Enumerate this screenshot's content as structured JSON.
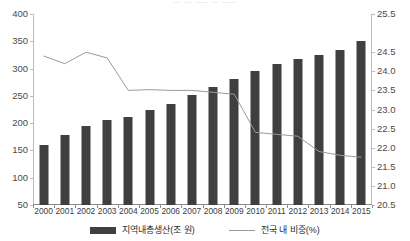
{
  "chart_data": {
    "type": "bar",
    "title": "",
    "xlabel": "",
    "ylabel": "",
    "grid": false,
    "legend_position": "bottom",
    "categories": [
      "2000",
      "2001",
      "2002",
      "2003",
      "2004",
      "2005",
      "2006",
      "2007",
      "2008",
      "2009",
      "2010",
      "2011",
      "2012",
      "2013",
      "2014",
      "2015"
    ],
    "axes": {
      "left": {
        "label": "지역내총생산(조 원)",
        "ylim": [
          0,
          400
        ],
        "ticks": [
          50,
          100,
          150,
          200,
          250,
          300,
          350,
          400
        ],
        "tick_labels": [
          "50",
          "100",
          "150",
          "200",
          "250",
          "300",
          "350",
          "400"
        ],
        "display_min": 50,
        "display_max": 400
      },
      "right": {
        "label": "전국 내 비중(%)",
        "ylim": [
          20.5,
          25.5
        ],
        "ticks": [
          20.5,
          21.0,
          21.5,
          22.0,
          22.5,
          23.0,
          23.5,
          24.0,
          24.5,
          25.5
        ],
        "tick_labels": [
          "20.5",
          "21.0",
          "21.5",
          "22.0",
          "22.5",
          "23.0",
          "23.5",
          "24.0",
          "24.5",
          "25.5"
        ],
        "display_min": 20.5,
        "display_max": 25.5
      }
    },
    "series": [
      {
        "name": "지역내총생산(조 원)",
        "type": "bar",
        "axis": "left",
        "color": "#3f3f3f",
        "values": [
          160,
          178,
          195,
          205,
          211,
          225,
          235,
          252,
          267,
          280,
          295,
          308,
          317,
          324,
          334,
          350
        ]
      },
      {
        "name": "전국 내 비중(%)",
        "type": "line",
        "axis": "right",
        "color": "#9a9a9a",
        "values": [
          24.4,
          24.2,
          24.5,
          24.35,
          23.5,
          23.52,
          23.5,
          23.5,
          23.45,
          23.4,
          22.4,
          22.35,
          22.3,
          21.9,
          21.8,
          21.75
        ]
      }
    ]
  },
  "legend": {
    "items": [
      {
        "label": "지역내총생산(조 원)",
        "marker": "bar-swatch",
        "color": "#3f3f3f"
      },
      {
        "label": "전국 내 비중(%)",
        "marker": "line-swatch",
        "color": "#9a9a9a"
      }
    ]
  },
  "title_remnant": "ㅡ  ㅡ ㅡㅡ  ㅡ  ㅡㅡ"
}
